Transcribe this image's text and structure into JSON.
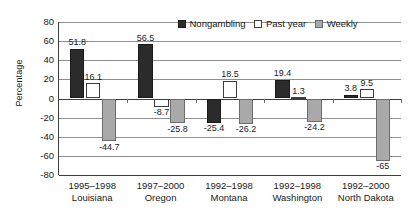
{
  "chart_data": {
    "type": "bar",
    "title": "",
    "xlabel": "",
    "ylabel": "Percentage",
    "ylim": [
      -80,
      80
    ],
    "yticks": [
      80,
      60,
      40,
      20,
      0,
      -20,
      -40,
      -60,
      -80
    ],
    "ytick_labels": [
      "80",
      "60",
      "40",
      "20",
      "0",
      "-20",
      "-40",
      "-60",
      "-80"
    ],
    "grid": true,
    "legend_position": "top-right",
    "categories": [
      "1995–1998 Louisiana",
      "1997–2000 Oregon",
      "1992–1998 Montana",
      "1992–1998 Washington",
      "1992–2000 North Dakota"
    ],
    "category_lines": [
      {
        "period": "1995–1998",
        "place": "Louisiana"
      },
      {
        "period": "1997–2000",
        "place": "Oregon"
      },
      {
        "period": "1992–1998",
        "place": "Montana"
      },
      {
        "period": "1992–1998",
        "place": "Washington"
      },
      {
        "period": "1992–2000",
        "place": "North Dakota"
      }
    ],
    "series": [
      {
        "name": "Nongambling",
        "color": "#2b2b2b",
        "values": [
          51.8,
          56.5,
          -25.4,
          19.4,
          3.8
        ],
        "value_labels": [
          "51.8",
          "56.5",
          "-25.4",
          "19.4",
          "3.8"
        ]
      },
      {
        "name": "Past year",
        "color": "#ffffff",
        "values": [
          16.1,
          -8.7,
          18.5,
          1.3,
          9.5
        ],
        "value_labels": [
          "16.1",
          "-8.7",
          "18.5",
          "1.3",
          "9.5"
        ]
      },
      {
        "name": "Weekly",
        "color": "#a9a9a9",
        "values": [
          -44.7,
          -25.8,
          -26.2,
          -24.2,
          -65
        ],
        "value_labels": [
          "-44.7",
          "-25.8",
          "-26.2",
          "-24.2",
          "-65"
        ]
      }
    ]
  },
  "legend": {
    "items": [
      {
        "label": "Nongambling"
      },
      {
        "label": "Past year"
      },
      {
        "label": "Weekly"
      }
    ]
  }
}
